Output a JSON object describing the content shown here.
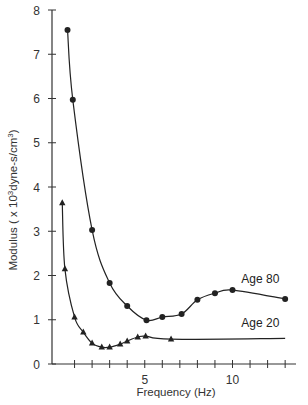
{
  "chart_data": {
    "type": "line",
    "title": "",
    "xlabel": "Frequency (Hz)",
    "ylabel": "Modulus ( x 10³dyne-s/cm³)",
    "ylabel_parts": {
      "prefix": "Modulus ( x 10",
      "sup1": "3",
      "mid": "dyne-s/cm",
      "sup2": "3",
      "suffix": ")"
    },
    "xlim": [
      0,
      13.5
    ],
    "ylim": [
      0,
      8
    ],
    "x_ticks": [
      1,
      2,
      3,
      4,
      5,
      6,
      7,
      8,
      9,
      10,
      11,
      12,
      13
    ],
    "x_tick_labels": [
      {
        "value": 5,
        "label": "5"
      },
      {
        "value": 10,
        "label": "10"
      }
    ],
    "y_ticks": [
      0,
      1,
      2,
      3,
      4,
      5,
      6,
      7,
      8
    ],
    "y_tick_labels": [
      "0",
      "1",
      "2",
      "3",
      "4",
      "5",
      "6",
      "7",
      "8"
    ],
    "grid": false,
    "legend": "inline labels",
    "series": [
      {
        "name": "Age 80",
        "marker": "circle",
        "color": "#222222",
        "x": [
          0.6,
          0.9,
          2.0,
          3.0,
          4.0,
          5.1,
          6.0,
          7.1,
          8.0,
          9.0,
          10.0,
          13.0
        ],
        "y": [
          7.55,
          5.97,
          3.03,
          1.83,
          1.31,
          0.99,
          1.06,
          1.13,
          1.45,
          1.6,
          1.67,
          1.47
        ],
        "label_pos": {
          "x": 10.5,
          "y": 1.82
        }
      },
      {
        "name": "Age 20",
        "marker": "triangle",
        "color": "#222222",
        "x": [
          0.3,
          0.45,
          1.0,
          1.5,
          2.0,
          2.55,
          3.0,
          3.6,
          4.0,
          4.6,
          5.05,
          6.5
        ],
        "y": [
          3.64,
          2.15,
          1.06,
          0.72,
          0.47,
          0.38,
          0.38,
          0.45,
          0.52,
          0.61,
          0.63,
          0.56
        ],
        "line_end": {
          "x": 13.0,
          "y": 0.58
        },
        "label_pos": {
          "x": 10.5,
          "y": 0.84
        }
      }
    ]
  }
}
